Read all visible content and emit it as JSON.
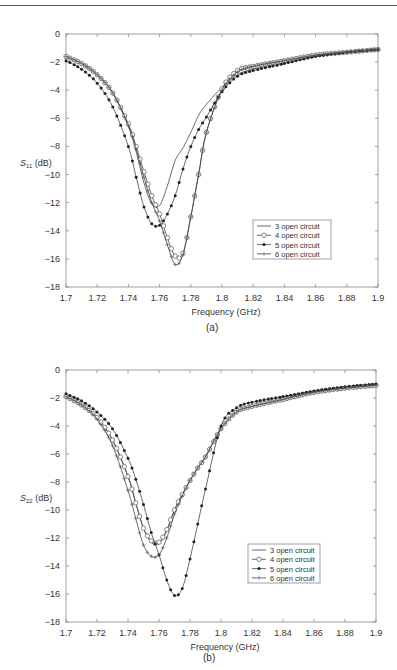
{
  "figure": {
    "panels": [
      {
        "label": "(a)",
        "ylabel_main": "S",
        "ylabel_sub": "11",
        "ylabel_unit": " (dB)",
        "xlabel": "Frequency (GHz)",
        "legend": [
          "3 open circuit",
          "4 open circuit",
          "5 open circuit",
          "6 open circuit"
        ]
      },
      {
        "label": "(b)",
        "ylabel_main": "S",
        "ylabel_sub": "22",
        "ylabel_unit": " (dB)",
        "xlabel": "Frequency (GHz)",
        "legend": [
          "3 open circuit",
          "4 open circuit",
          "5 open circuit",
          "6 open circuit"
        ]
      }
    ]
  },
  "chart_data": [
    {
      "type": "line",
      "title": "(a)",
      "xlabel": "Frequency (GHz)",
      "ylabel": "S11 (dB)",
      "xlim": [
        1.7,
        1.9
      ],
      "ylim": [
        -18,
        0
      ],
      "xticks": [
        "1.7",
        "1.72",
        "1.74",
        "1.76",
        "1.78",
        "1.8",
        "1.82",
        "1.84",
        "1.86",
        "1.88",
        "1.9"
      ],
      "yticks": [
        "0",
        "-2",
        "-4",
        "-6",
        "-8",
        "-10",
        "-12",
        "-14",
        "-16",
        "-18"
      ],
      "grid": false,
      "legend_position": "lower right inside",
      "x": [
        1.7,
        1.71,
        1.72,
        1.73,
        1.74,
        1.745,
        1.75,
        1.755,
        1.76,
        1.765,
        1.77,
        1.775,
        1.78,
        1.785,
        1.79,
        1.8,
        1.81,
        1.82,
        1.84,
        1.86,
        1.88,
        1.9
      ],
      "series": [
        {
          "name": "3 open circuit",
          "marker": "none",
          "values": [
            -1.6,
            -2.1,
            -2.9,
            -4.2,
            -6.6,
            -8.4,
            -10.6,
            -12.1,
            -12.2,
            -10.8,
            -9.0,
            -8.1,
            -7.0,
            -5.8,
            -5.0,
            -3.8,
            -2.9,
            -2.5,
            -2.0,
            -1.6,
            -1.3,
            -1.1
          ]
        },
        {
          "name": "4 open circuit",
          "marker": "circle",
          "values": [
            -1.6,
            -2.1,
            -2.9,
            -4.2,
            -6.4,
            -8.0,
            -9.8,
            -11.5,
            -12.8,
            -14.5,
            -15.8,
            -15.6,
            -13.0,
            -10.0,
            -7.0,
            -3.9,
            -2.6,
            -2.3,
            -1.9,
            -1.5,
            -1.3,
            -1.1
          ]
        },
        {
          "name": "5 open circuit",
          "marker": "dot",
          "values": [
            -1.9,
            -2.5,
            -3.5,
            -5.2,
            -8.0,
            -10.2,
            -12.3,
            -13.5,
            -13.6,
            -12.8,
            -11.5,
            -9.6,
            -8.0,
            -6.8,
            -5.9,
            -4.1,
            -3.0,
            -2.6,
            -2.1,
            -1.6,
            -1.3,
            -1.1
          ]
        },
        {
          "name": "6 open circuit",
          "marker": "plus",
          "values": [
            -1.6,
            -2.1,
            -2.9,
            -4.2,
            -6.5,
            -8.2,
            -10.2,
            -12.0,
            -13.3,
            -15.0,
            -16.4,
            -15.7,
            -13.0,
            -10.0,
            -7.0,
            -4.0,
            -2.7,
            -2.3,
            -1.9,
            -1.5,
            -1.3,
            -1.1
          ]
        }
      ]
    },
    {
      "type": "line",
      "title": "(b)",
      "xlabel": "Frequency (GHz)",
      "ylabel": "S22 (dB)",
      "xlim": [
        1.7,
        1.9
      ],
      "ylim": [
        -18,
        0
      ],
      "xticks": [
        "1.7",
        "1.72",
        "1.74",
        "1.76",
        "1.78",
        "1.8",
        "1.82",
        "1.84",
        "1.86",
        "1.88",
        "1.9"
      ],
      "yticks": [
        "0",
        "-2",
        "-4",
        "-6",
        "-8",
        "-10",
        "-12",
        "-14",
        "-16",
        "-18"
      ],
      "grid": false,
      "legend_position": "lower right inside",
      "x": [
        1.7,
        1.71,
        1.72,
        1.73,
        1.74,
        1.745,
        1.75,
        1.755,
        1.76,
        1.765,
        1.77,
        1.775,
        1.78,
        1.785,
        1.79,
        1.8,
        1.81,
        1.82,
        1.84,
        1.86,
        1.88,
        1.9
      ],
      "series": [
        {
          "name": "3 open circuit",
          "marker": "none",
          "values": [
            -1.9,
            -2.5,
            -3.4,
            -5.0,
            -7.6,
            -9.5,
            -11.3,
            -12.3,
            -12.4,
            -11.5,
            -10.0,
            -8.9,
            -7.9,
            -7.0,
            -6.2,
            -4.2,
            -3.0,
            -2.6,
            -2.1,
            -1.6,
            -1.3,
            -1.1
          ]
        },
        {
          "name": "4 open circuit",
          "marker": "circle",
          "values": [
            -1.9,
            -2.5,
            -3.4,
            -5.0,
            -7.6,
            -9.5,
            -11.3,
            -12.2,
            -12.3,
            -11.4,
            -10.0,
            -8.9,
            -7.9,
            -7.0,
            -6.2,
            -4.2,
            -3.0,
            -2.6,
            -2.1,
            -1.6,
            -1.3,
            -1.1
          ]
        },
        {
          "name": "5 open circuit",
          "marker": "dot",
          "values": [
            -1.7,
            -2.2,
            -3.0,
            -4.2,
            -6.3,
            -7.8,
            -9.6,
            -11.6,
            -13.2,
            -15.0,
            -16.1,
            -15.6,
            -13.5,
            -11.0,
            -8.5,
            -4.0,
            -2.7,
            -2.3,
            -1.9,
            -1.5,
            -1.2,
            -1.0
          ]
        },
        {
          "name": "6 open circuit",
          "marker": "plus",
          "values": [
            -1.9,
            -2.5,
            -3.5,
            -5.4,
            -8.6,
            -10.6,
            -12.5,
            -13.3,
            -13.2,
            -12.0,
            -10.3,
            -9.0,
            -7.9,
            -7.0,
            -6.2,
            -4.2,
            -3.0,
            -2.6,
            -2.1,
            -1.6,
            -1.3,
            -1.1
          ]
        }
      ]
    }
  ]
}
